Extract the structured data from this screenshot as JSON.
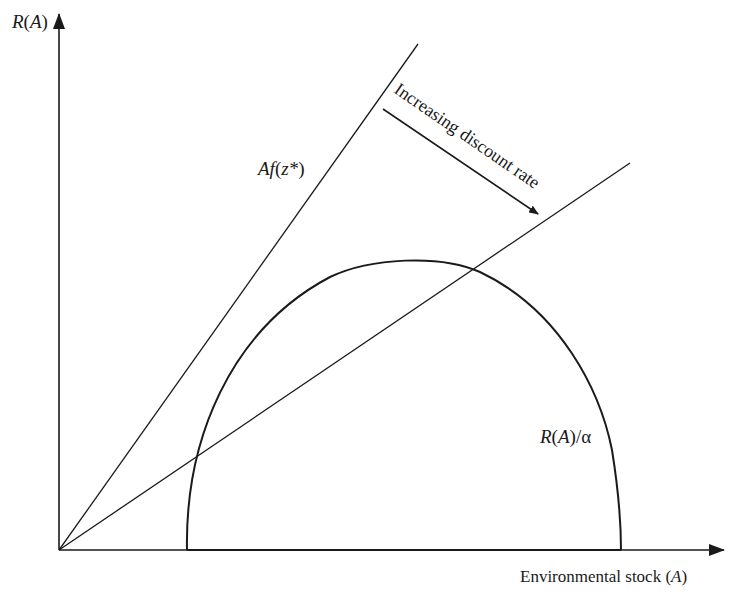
{
  "diagram": {
    "type": "economic-diagram",
    "y_axis_label": {
      "func": "R",
      "arg": "A"
    },
    "x_axis_label": {
      "text": "Environmental stock ",
      "var": "A"
    },
    "line_steep_label": {
      "prefix": "A",
      "func": "f",
      "arg": "z*"
    },
    "curve_label": {
      "func": "R",
      "arg": "A",
      "suffix": "/α"
    },
    "arrow_annotation": "Increasing discount rate",
    "colors": {
      "ink": "#1a1a1a",
      "background": "#ffffff"
    }
  }
}
